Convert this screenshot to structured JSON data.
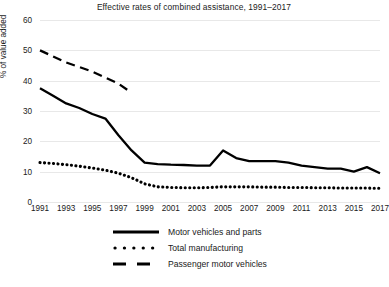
{
  "chart": {
    "title": "Effective rates of combined assistance, 1991–2017",
    "ylabel": "% of value added"
  },
  "axis": {
    "yticks": [
      "0",
      "10",
      "20",
      "30",
      "40",
      "50",
      "60"
    ],
    "xticks": [
      "1991",
      "1993",
      "1995",
      "1997",
      "1999",
      "2001",
      "2003",
      "2005",
      "2007",
      "2009",
      "2011",
      "2013",
      "2015",
      "2017"
    ]
  },
  "legend": {
    "items": [
      {
        "label": "Motor vehicles and parts",
        "marker": "solid-line-swatch"
      },
      {
        "label": "Total manufacturing",
        "marker": "dotted-line-swatch"
      },
      {
        "label": "Passenger motor vehicles",
        "marker": "dashed-line-swatch"
      }
    ]
  },
  "chart_data": {
    "type": "line",
    "title": "Effective rates of combined assistance, 1991–2017",
    "xlabel": "",
    "ylabel": "% of value added",
    "xlim": [
      1991,
      2017
    ],
    "ylim": [
      0,
      60
    ],
    "grid": true,
    "legend_position": "bottom",
    "x": [
      1991,
      1992,
      1993,
      1994,
      1995,
      1996,
      1997,
      1998,
      1999,
      2000,
      2001,
      2002,
      2003,
      2004,
      2005,
      2006,
      2007,
      2008,
      2009,
      2010,
      2011,
      2012,
      2013,
      2014,
      2015,
      2016,
      2017
    ],
    "series": [
      {
        "name": "Motor vehicles and parts",
        "style": "solid",
        "values": [
          37.5,
          35.0,
          32.5,
          31.0,
          29.0,
          27.5,
          22.0,
          17.0,
          13.0,
          12.5,
          12.3,
          12.2,
          12.0,
          12.0,
          17.0,
          14.5,
          13.5,
          13.5,
          13.5,
          13.0,
          12.0,
          11.5,
          11.0,
          11.0,
          10.0,
          11.5,
          9.5
        ]
      },
      {
        "name": "Total manufacturing",
        "style": "dotted",
        "values": [
          13.0,
          12.7,
          12.3,
          11.8,
          11.2,
          10.5,
          9.5,
          8.0,
          6.0,
          5.0,
          4.8,
          4.7,
          4.7,
          4.8,
          5.0,
          5.0,
          5.0,
          4.9,
          4.9,
          4.8,
          4.8,
          4.7,
          4.7,
          4.6,
          4.6,
          4.6,
          4.5
        ]
      },
      {
        "name": "Passenger motor vehicles",
        "style": "dashed",
        "x": [
          1991,
          1992,
          1993,
          1994,
          1995,
          1996,
          1997,
          1998
        ],
        "values": [
          50.0,
          48.0,
          46.0,
          44.5,
          43.0,
          41.0,
          39.0,
          36.0
        ]
      }
    ]
  }
}
